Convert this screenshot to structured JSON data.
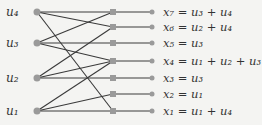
{
  "inputs": [
    {
      "id": "u4",
      "label": "u₄",
      "y": 12
    },
    {
      "id": "u3",
      "label": "u₃",
      "y": 43
    },
    {
      "id": "u2",
      "label": "u₂",
      "y": 78
    },
    {
      "id": "u1",
      "label": "u₁",
      "y": 111
    }
  ],
  "outputs": [
    {
      "id": "x7",
      "label": "x₇ = u₃ + u₄",
      "y": 12
    },
    {
      "id": "x6",
      "label": "x₆ = u₂ + u₄",
      "y": 27
    },
    {
      "id": "x5",
      "label": "x₅ = u₃",
      "y": 43
    },
    {
      "id": "x4",
      "label": "x₄ = u₁ + u₂ + u₃",
      "y": 61
    },
    {
      "id": "x3",
      "label": "x₃ = u₃",
      "y": 78
    },
    {
      "id": "x2",
      "label": "x₂ = u₁",
      "y": 94
    },
    {
      "id": "x1",
      "label": "x₁ = u₁ + u₄",
      "y": 111
    }
  ],
  "edges": [
    [
      "u4",
      "x7"
    ],
    [
      "u4",
      "x6"
    ],
    [
      "u4",
      "x1"
    ],
    [
      "u3",
      "x7"
    ],
    [
      "u3",
      "x5"
    ],
    [
      "u3",
      "x4"
    ],
    [
      "u2",
      "x6"
    ],
    [
      "u2",
      "x4"
    ],
    [
      "u2",
      "x3"
    ],
    [
      "u1",
      "x4"
    ],
    [
      "u1",
      "x2"
    ],
    [
      "u1",
      "x1"
    ]
  ],
  "colors": {
    "line": "#3a3a3a",
    "node": "#9a9a9a"
  }
}
